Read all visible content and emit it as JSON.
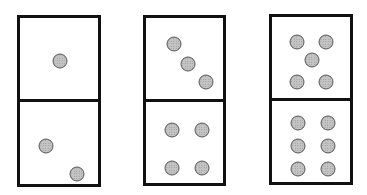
{
  "dominoes": [
    {
      "top_value": 1,
      "bottom_value": 2,
      "box": {
        "left": 17,
        "top": 15,
        "width": 84,
        "height": 172
      },
      "top_pips": [
        [
          40,
          43
        ]
      ],
      "bottom_pips": [
        [
          26,
          44
        ],
        [
          57,
          72
        ]
      ]
    },
    {
      "top_value": 3,
      "bottom_value": 4,
      "box": {
        "left": 143,
        "top": 15,
        "width": 83,
        "height": 171
      },
      "top_pips": [
        [
          28,
          26
        ],
        [
          42,
          46
        ],
        [
          60,
          64
        ]
      ],
      "bottom_pips": [
        [
          26,
          28
        ],
        [
          56,
          28
        ],
        [
          26,
          66
        ],
        [
          56,
          66
        ]
      ]
    },
    {
      "top_value": 5,
      "bottom_value": 6,
      "box": {
        "left": 269,
        "top": 14,
        "width": 84,
        "height": 171
      },
      "top_pips": [
        [
          25,
          25
        ],
        [
          54,
          25
        ],
        [
          40,
          43
        ],
        [
          25,
          65
        ],
        [
          54,
          65
        ]
      ],
      "bottom_pips": [
        [
          26,
          22
        ],
        [
          56,
          22
        ],
        [
          26,
          45
        ],
        [
          56,
          45
        ],
        [
          26,
          68
        ],
        [
          56,
          68
        ]
      ]
    }
  ]
}
